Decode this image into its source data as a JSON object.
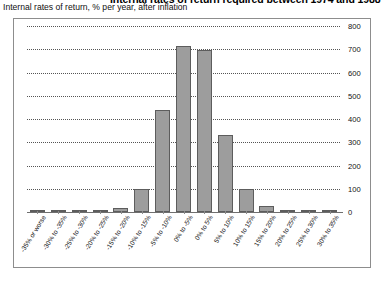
{
  "header": {
    "title": "Internal rates of return required between 1974 and 1988",
    "subtitle": "Internal rates of return, % per year, after inflation"
  },
  "chart_data": {
    "type": "bar",
    "title": "Internal rates of return required between 1974 and 1988",
    "subtitle": "Internal rates of return, % per year, after inflation",
    "xlabel": "",
    "ylabel": "",
    "ylim": [
      0,
      800
    ],
    "yticks": [
      0,
      100,
      200,
      300,
      400,
      500,
      600,
      700,
      800
    ],
    "grid": true,
    "legend": "none",
    "bar_color": "#9d9d9d",
    "bar_border_color": "#5d5d5d",
    "categories": [
      "-35% or worse",
      "-30% to -35%",
      "-25% to -30%",
      "-20% to -25%",
      "-15% to -20%",
      "-10% to -15%",
      "-5% to -10%",
      "0% to -5%",
      "0% to 5%",
      "5% to 10%",
      "10% to 15%",
      "15% to 20%",
      "20% to 25%",
      "25% to 30%",
      "30% to 35%"
    ],
    "values": [
      2,
      3,
      4,
      10,
      18,
      100,
      440,
      715,
      697,
      330,
      100,
      28,
      6,
      3,
      2
    ]
  }
}
